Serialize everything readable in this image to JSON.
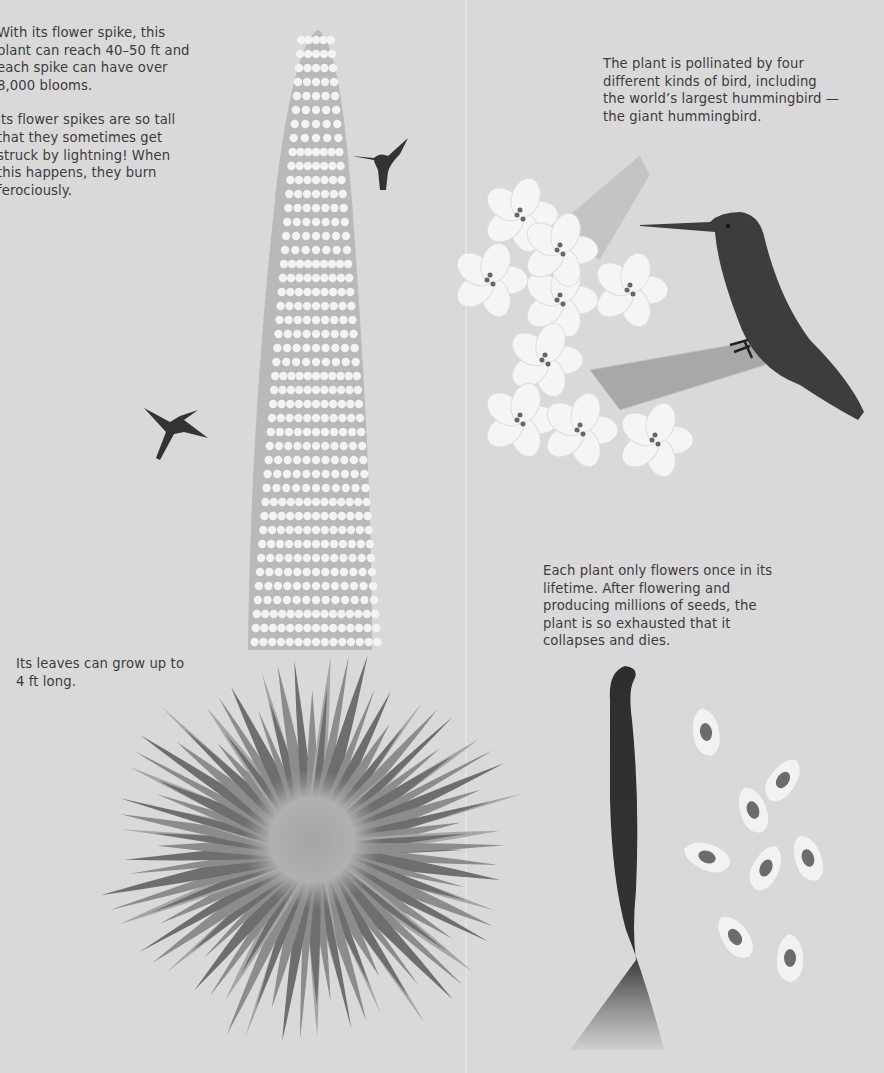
{
  "page": {
    "background_color": "#d9d9d9",
    "text_color": "#3c3c3c"
  },
  "captions": {
    "spike_height": "With its flower spike, this plant can reach 40–50 ft and each spike can have over 8,000 blooms.",
    "lightning": "Its flower spikes are so tall that they sometimes get struck by lightning! When this happens, they burn ferociously.",
    "pollination": "The plant is pollinated by four different kinds of bird, including the world’s largest hummingbird —the giant hummingbird.",
    "lifecycle": "Each plant only flowers once in its lifetime. After flowering and producing millions of seeds, the plant is so exhausted that it collapses and dies.",
    "leaves": "Its leaves can grow up to 4 ft long."
  },
  "illustrations": {
    "flower_spike": "flower-spike-illustration",
    "rosette": "leaf-rosette-illustration",
    "hummingbird_small_1": "hummingbird-icon",
    "hummingbird_small_2": "hummingbird-icon",
    "giant_hummingbird": "giant-hummingbird-icon",
    "flower_closeup": "flower-cluster-illustration",
    "dead_plant": "dead-plant-illustration",
    "seeds": "seed-icon"
  },
  "colors": {
    "bloom_white": "#f4f4f4",
    "spike_gray": "#b8b8b8",
    "leaf_light": "#a8a8a8",
    "leaf_dark": "#707070",
    "bird_dark": "#3a3a3a",
    "dead_stalk": "#2e2e2e",
    "seed_core": "#6c6c6c"
  },
  "seed_count": 8
}
